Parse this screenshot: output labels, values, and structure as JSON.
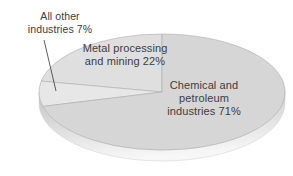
{
  "chart_data": {
    "type": "pie",
    "style": "3d-ellipse",
    "title": "",
    "start_angle_deg": 90,
    "direction": "ccw",
    "slices": [
      {
        "id": "metal-processing-mining",
        "name": "Metal processing and mining",
        "value": 22,
        "label": "Metal processing\nand mining 22%",
        "color": "#dfdfdf"
      },
      {
        "id": "all-other-industries",
        "name": "All other industries",
        "value": 7,
        "label": "All other\nindustries 7%",
        "color": "#e7e7e7"
      },
      {
        "id": "chemical-petroleum",
        "name": "Chemical and petroleum industries",
        "value": 71,
        "label": "Chemical and\npetroleum\nindustries 71%",
        "color": "#d6d6d6"
      }
    ],
    "edge_color": "#adadad",
    "rim_colors": [
      "#c3c3c3",
      "#f7f7f7"
    ],
    "leader_line_color": "#4a4a4a",
    "text_color": "#3d3d3d",
    "background": "#ffffff",
    "legend": "none",
    "annotations": "labels placed beside or on slices; thin leader line from 'All other industries 7%' label to its slice"
  }
}
